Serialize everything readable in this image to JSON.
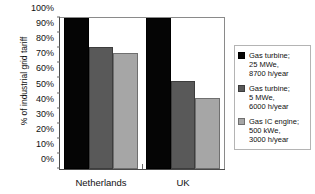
{
  "chart_data": {
    "type": "bar",
    "title": "",
    "xlabel": "",
    "ylabel": "% of industrial grid tariff",
    "categories": [
      "Netherlands",
      "UK"
    ],
    "series": [
      {
        "name": "Gas turbine; 25 MWe, 8700 h/year",
        "values": [
          100,
          100
        ]
      },
      {
        "name": "Gas turbine; 5 MWe, 6000 h/year",
        "values": [
          81,
          58
        ]
      },
      {
        "name": "Gas IC engine; 500 kWe, 3000 h/year",
        "values": [
          77,
          47
        ]
      }
    ],
    "ylim": [
      0,
      100
    ],
    "ytick_labels": [
      "100%",
      "90%",
      "80%",
      "70%",
      "60%",
      "50%",
      "40%",
      "30%",
      "20%",
      "10%",
      "0%"
    ],
    "ytick_values": [
      100,
      90,
      80,
      70,
      60,
      50,
      40,
      30,
      20,
      10,
      0
    ],
    "grid": false,
    "legend_position": "right"
  },
  "legend": {
    "items": [
      {
        "swatch_color": "#050505",
        "line1": "Gas turbine;",
        "line2": "25 MWe,",
        "line3": "8700 h/year"
      },
      {
        "swatch_color": "#595959",
        "line1": "Gas turbine;",
        "line2": "5 MWe,",
        "line3": "6000 h/year"
      },
      {
        "swatch_color": "#a6a6a6",
        "line1": "Gas IC engine;",
        "line2": "500 kWe,",
        "line3": "3000 h/year"
      }
    ]
  },
  "colors": {
    "series0": "#050505",
    "series1": "#595959",
    "series2": "#a6a6a6",
    "axis": "#4a4a4a",
    "frame": "#8a8a8a",
    "text": "#111111",
    "background": "#ffffff"
  }
}
